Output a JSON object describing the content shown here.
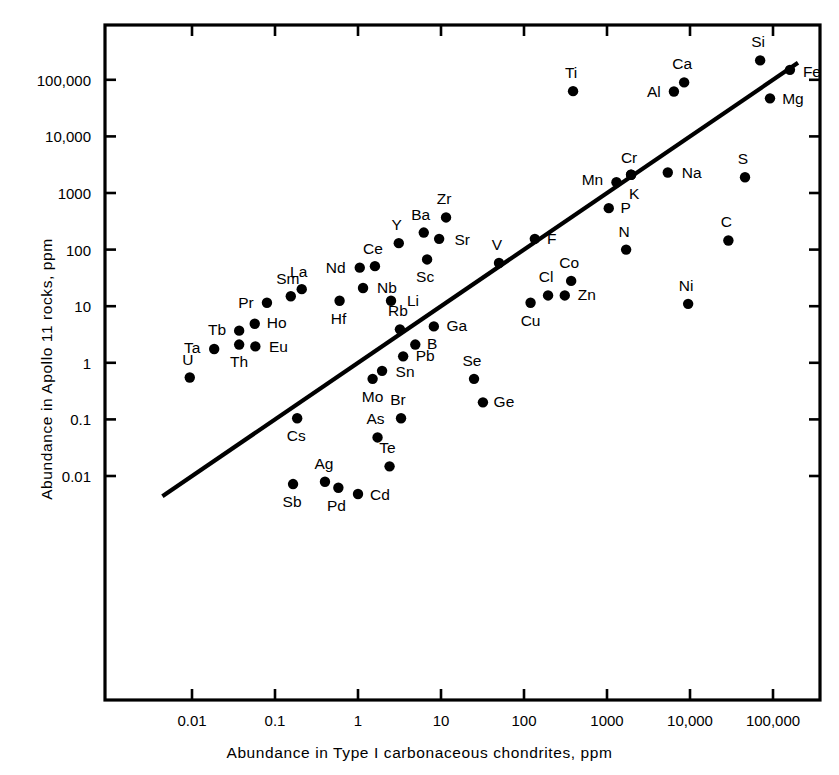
{
  "chart_data": {
    "type": "scatter",
    "title": "",
    "xlabel": "Abundance in Type I carbonaceous chondrites, ppm",
    "ylabel": "Abundance in Apollo 11 rocks, ppm",
    "xscale": "log",
    "yscale": "log",
    "xlim": [
      0.0017,
      1000000
    ],
    "ylim": [
      0.0016,
      1300000
    ],
    "grid": false,
    "legend": null,
    "xticks": [
      "0.01",
      "0.1",
      "1",
      "10",
      "100",
      "1000",
      "10,000",
      "100,000"
    ],
    "xtick_values": [
      0.01,
      0.1,
      1,
      10,
      100,
      1000,
      10000,
      100000
    ],
    "yticks": [
      "0.01",
      "0.1",
      "1",
      "10",
      "100",
      "1000",
      "10,000",
      "100,000"
    ],
    "ytick_values": [
      0.01,
      0.1,
      1,
      10,
      100,
      1000,
      10000,
      100000
    ],
    "reference_line": {
      "description": "1:1 diagonal equal-abundance line",
      "x": [
        0.0044,
        200000
      ],
      "y": [
        0.0044,
        200000
      ]
    },
    "point_label_key": "chemical element symbol",
    "points": [
      {
        "label": "U",
        "x": 0.0094,
        "y": 0.55,
        "label_dx": -2,
        "label_dy": -17
      },
      {
        "label": "Ta",
        "x": 0.0185,
        "y": 1.75,
        "label_dx": -22,
        "label_dy": -1
      },
      {
        "label": "Th",
        "x": 0.037,
        "y": 2.1,
        "label_dx": 0,
        "label_dy": 17
      },
      {
        "label": "Eu",
        "x": 0.058,
        "y": 1.95,
        "label_dx": 23,
        "label_dy": 1
      },
      {
        "label": "Tb",
        "x": 0.037,
        "y": 3.7,
        "label_dx": -22,
        "label_dy": -1
      },
      {
        "label": "Ho",
        "x": 0.057,
        "y": 4.9,
        "label_dx": 22,
        "label_dy": -1
      },
      {
        "label": "Pr",
        "x": 0.08,
        "y": 11.5,
        "label_dx": -21,
        "label_dy": 0
      },
      {
        "label": "Sm",
        "x": 0.155,
        "y": 15.0,
        "label_dx": -3,
        "label_dy": -17
      },
      {
        "label": "La",
        "x": 0.21,
        "y": 20.0,
        "label_dx": -3,
        "label_dy": -17
      },
      {
        "label": "Hf",
        "x": 0.6,
        "y": 12.5,
        "label_dx": -1,
        "label_dy": 18
      },
      {
        "label": "Nd",
        "x": 1.05,
        "y": 48.0,
        "label_dx": -24,
        "label_dy": 0
      },
      {
        "label": "Ce",
        "x": 1.6,
        "y": 51.0,
        "label_dx": -2,
        "label_dy": -17
      },
      {
        "label": "Nb",
        "x": 1.15,
        "y": 21.0,
        "label_dx": 24,
        "label_dy": 0
      },
      {
        "label": "Li",
        "x": 2.5,
        "y": 12.5,
        "label_dx": 22,
        "label_dy": 0
      },
      {
        "label": "Y",
        "x": 3.1,
        "y": 130.0,
        "label_dx": -2,
        "label_dy": -18
      },
      {
        "label": "Ba",
        "x": 6.2,
        "y": 200.0,
        "label_dx": -3,
        "label_dy": -18
      },
      {
        "label": "Zr",
        "x": 11.5,
        "y": 370.0,
        "label_dx": -2,
        "label_dy": -18
      },
      {
        "label": "Sr",
        "x": 9.5,
        "y": 155.0,
        "label_dx": 23,
        "label_dy": 1
      },
      {
        "label": "Sc",
        "x": 6.8,
        "y": 67.0,
        "label_dx": -2,
        "label_dy": 18
      },
      {
        "label": "Rb",
        "x": 3.2,
        "y": 3.9,
        "label_dx": -2,
        "label_dy": -18
      },
      {
        "label": "Ga",
        "x": 8.2,
        "y": 4.4,
        "label_dx": 23,
        "label_dy": 0
      },
      {
        "label": "B",
        "x": 4.9,
        "y": 2.1,
        "label_dx": 17,
        "label_dy": -1
      },
      {
        "label": "Pb",
        "x": 3.5,
        "y": 1.3,
        "label_dx": 22,
        "label_dy": 0
      },
      {
        "label": "Sn",
        "x": 1.95,
        "y": 0.72,
        "label_dx": 23,
        "label_dy": 1
      },
      {
        "label": "Mo",
        "x": 1.5,
        "y": 0.52,
        "label_dx": 0,
        "label_dy": 18
      },
      {
        "label": "Cs",
        "x": 0.185,
        "y": 0.105,
        "label_dx": -1,
        "label_dy": 18
      },
      {
        "label": "As",
        "x": 1.72,
        "y": 0.048,
        "label_dx": -2,
        "label_dy": -18
      },
      {
        "label": "Br",
        "x": 3.3,
        "y": 0.105,
        "label_dx": -3,
        "label_dy": -18
      },
      {
        "label": "Te",
        "x": 2.4,
        "y": 0.0148,
        "label_dx": -2,
        "label_dy": -18
      },
      {
        "label": "Sb",
        "x": 0.165,
        "y": 0.0072,
        "label_dx": -1,
        "label_dy": 18
      },
      {
        "label": "Ag",
        "x": 0.4,
        "y": 0.0079,
        "label_dx": -1,
        "label_dy": -18
      },
      {
        "label": "Pd",
        "x": 0.58,
        "y": 0.0062,
        "label_dx": -2,
        "label_dy": 18
      },
      {
        "label": "Cd",
        "x": 1.0,
        "y": 0.0048,
        "label_dx": 22,
        "label_dy": 1
      },
      {
        "label": "Se",
        "x": 25.0,
        "y": 0.52,
        "label_dx": -2,
        "label_dy": -18
      },
      {
        "label": "Ge",
        "x": 32.0,
        "y": 0.2,
        "label_dx": 21,
        "label_dy": 0
      },
      {
        "label": "Cu",
        "x": 120.0,
        "y": 11.5,
        "label_dx": 0,
        "label_dy": 18
      },
      {
        "label": "Cl",
        "x": 195.0,
        "y": 15.5,
        "label_dx": -2,
        "label_dy": -18
      },
      {
        "label": "Zn",
        "x": 310.0,
        "y": 15.5,
        "label_dx": 22,
        "label_dy": 0
      },
      {
        "label": "Co",
        "x": 370.0,
        "y": 28.0,
        "label_dx": -2,
        "label_dy": -18
      },
      {
        "label": "V",
        "x": 50.0,
        "y": 58.0,
        "label_dx": -2,
        "label_dy": -18
      },
      {
        "label": "F",
        "x": 135.0,
        "y": 155.0,
        "label_dx": 17,
        "label_dy": 0
      },
      {
        "label": "N",
        "x": 1700.0,
        "y": 100.0,
        "label_dx": -2,
        "label_dy": -18
      },
      {
        "label": "P",
        "x": 1050.0,
        "y": 540.0,
        "label_dx": 17,
        "label_dy": 0
      },
      {
        "label": "Mn",
        "x": 1300.0,
        "y": 1550.0,
        "label_dx": -24,
        "label_dy": -2
      },
      {
        "label": "Cr",
        "x": 1950.0,
        "y": 2100.0,
        "label_dx": -2,
        "label_dy": -17
      },
      {
        "label": "K",
        "x": 1950.0,
        "y": 2100.0,
        "label_dx": 3,
        "label_dy": 19
      },
      {
        "label": "Na",
        "x": 5400.0,
        "y": 2300.0,
        "label_dx": 24,
        "label_dy": 0
      },
      {
        "label": "S",
        "x": 46000.0,
        "y": 1900.0,
        "label_dx": -2,
        "label_dy": -18
      },
      {
        "label": "C",
        "x": 29000.0,
        "y": 145.0,
        "label_dx": -2,
        "label_dy": -18
      },
      {
        "label": "Ni",
        "x": 9500.0,
        "y": 11.0,
        "label_dx": -2,
        "label_dy": -18
      },
      {
        "label": "Ti",
        "x": 390.0,
        "y": 63000.0,
        "label_dx": -2,
        "label_dy": -18
      },
      {
        "label": "Al",
        "x": 6400.0,
        "y": 62000.0,
        "label_dx": -20,
        "label_dy": 0
      },
      {
        "label": "Ca",
        "x": 8500.0,
        "y": 90000.0,
        "label_dx": -2,
        "label_dy": -18
      },
      {
        "label": "Si",
        "x": 70000.0,
        "y": 220000.0,
        "label_dx": -2,
        "label_dy": -18
      },
      {
        "label": "Fe",
        "x": 160000.0,
        "y": 150000.0,
        "label_dx": 22,
        "label_dy": 2
      },
      {
        "label": "Mg",
        "x": 92000.0,
        "y": 47000.0,
        "label_dx": 23,
        "label_dy": 1
      }
    ]
  },
  "style": {
    "axis_color": "#000000",
    "point_color": "#000000",
    "line_color": "#000000",
    "background": "#ffffff"
  }
}
